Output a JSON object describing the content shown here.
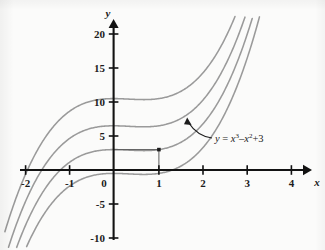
{
  "figure": {
    "kind": "cartesian-plot",
    "background_color": "#fbfbfa",
    "axis_color": "#121212",
    "curve_color": "#9a9a9a",
    "annotation_color": "#1c1c1c"
  },
  "axes": {
    "x": {
      "label": "x",
      "ticks": [
        "-2",
        "-1",
        "0",
        "1",
        "2",
        "3",
        "4"
      ],
      "tick_values": [
        -2,
        -1,
        0,
        1,
        2,
        3,
        4
      ],
      "range": [
        -2.3,
        4.35
      ]
    },
    "y": {
      "label": "y",
      "ticks": [
        "20",
        "15",
        "10",
        "5",
        "0",
        "-5",
        "-10"
      ],
      "tick_values": [
        20,
        15,
        10,
        5,
        0,
        -5,
        -10
      ],
      "range": [
        -11.5,
        22.5
      ]
    }
  },
  "annotation": {
    "equation_prefix": "y",
    "equation_eq": " = ",
    "equation_x1": "x",
    "equation_exp1": "3",
    "equation_minus": "–",
    "equation_x2": "x",
    "equation_exp2": "2",
    "equation_plus": "+",
    "equation_const": "3",
    "equation_plain": "y = x³ – x² + 3",
    "arrow": "curved-arrow-pointing-up-left"
  },
  "marked_point": {
    "x": 1,
    "y": 3,
    "has_horizontal_guide": true,
    "has_vertical_guide": true
  },
  "chart_data": {
    "type": "line",
    "title": "",
    "xlabel": "x",
    "ylabel": "y",
    "xlim": [
      -2.3,
      4.35
    ],
    "ylim": [
      -11.5,
      22.5
    ],
    "grid": false,
    "legend": "none",
    "xticks": [
      -2,
      -1,
      0,
      1,
      2,
      3,
      4
    ],
    "yticks": [
      20,
      15,
      10,
      5,
      0,
      -5,
      -10
    ],
    "annotations": [
      {
        "text": "y = x³ – x² + 3",
        "x": 2.15,
        "y": 4.6,
        "points_to_x": 1.45,
        "points_to_y": 7.0
      }
    ],
    "markers": [
      {
        "x": 1,
        "y": 3,
        "style": "filled-square-dot"
      }
    ],
    "series": [
      {
        "name": "y = x^3 - x^2 + 10.5",
        "formula": "x^3 - x^2 + 10.5",
        "C": 10.5,
        "x": [
          -2.3,
          -2.1,
          -1.9,
          -1.7,
          -1.5,
          -1.3,
          -1.1,
          -0.9,
          -0.7,
          -0.5,
          -0.3,
          -0.1,
          0.1,
          0.3,
          0.5,
          0.7,
          0.9,
          1.1,
          1.3,
          1.5,
          1.7,
          1.9,
          2.1
        ],
        "values": [
          -6.96,
          -3.56,
          -0.95,
          0.69,
          4.31,
          6.63,
          8.36,
          9.96,
          9.67,
          10.13,
          10.38,
          10.49,
          10.49,
          10.44,
          10.38,
          10.35,
          10.42,
          10.62,
          11.01,
          11.63,
          12.52,
          13.75,
          15.35
        ]
      },
      {
        "name": "y = x^3 - x^2 + 6.5",
        "formula": "x^3 - x^2 + 6.5",
        "C": 6.5,
        "x": [
          -2.3,
          -2.1,
          -1.9,
          -1.7,
          -1.5,
          -1.3,
          -1.1,
          -0.9,
          -0.7,
          -0.5,
          -0.3,
          -0.1,
          0.1,
          0.3,
          0.5,
          0.7,
          0.9,
          1.1,
          1.3,
          1.5,
          1.7,
          1.9,
          2.1
        ],
        "values": [
          -10.96,
          -7.56,
          -4.95,
          -2.91,
          -0.63,
          1.61,
          3.96,
          5.96,
          5.67,
          6.13,
          6.38,
          6.49,
          6.49,
          6.44,
          6.38,
          6.35,
          6.42,
          6.62,
          7.01,
          7.63,
          8.52,
          9.75,
          11.35
        ]
      },
      {
        "name": "y = x^3 - x^2 + 3",
        "formula": "x^3 - x^2 + 3",
        "C": 3,
        "highlighted": true,
        "x": [
          -2.3,
          -2.1,
          -1.9,
          -1.7,
          -1.5,
          -1.3,
          -1.1,
          -0.9,
          -0.7,
          -0.5,
          -0.3,
          -0.1,
          0.1,
          0.3,
          0.5,
          0.7,
          0.9,
          1.1,
          1.3,
          1.5,
          1.7,
          1.9,
          2.1
        ],
        "values": [
          -14.46,
          -11.06,
          -8.45,
          -6.41,
          -4.13,
          -1.89,
          0.46,
          2.46,
          2.17,
          2.63,
          2.88,
          2.99,
          2.99,
          2.94,
          2.88,
          2.85,
          2.92,
          3.12,
          3.51,
          4.13,
          5.02,
          6.25,
          7.85
        ]
      },
      {
        "name": "y = x^3 - x^2 - 0.5",
        "formula": "x^3 - x^2 - 0.5",
        "C": -0.5,
        "x": [
          -2.3,
          -2.1,
          -1.9,
          -1.7,
          -1.5,
          -1.3,
          -1.1,
          -0.9,
          -0.7,
          -0.5,
          -0.3,
          -0.1,
          0.1,
          0.3,
          0.5,
          0.7,
          0.9,
          1.1,
          1.3,
          1.5,
          1.7,
          1.9,
          2.1
        ],
        "values": [
          -17.96,
          -14.56,
          -11.95,
          -9.91,
          -7.63,
          -5.39,
          -3.04,
          -1.04,
          -1.33,
          -0.87,
          -0.62,
          -0.51,
          -0.51,
          -0.56,
          -0.62,
          -0.65,
          -0.58,
          -0.38,
          0.01,
          0.63,
          1.52,
          2.75,
          4.35
        ]
      }
    ]
  }
}
